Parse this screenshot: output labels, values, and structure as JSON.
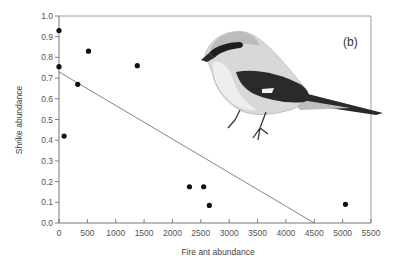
{
  "chart_data": {
    "type": "scatter",
    "title": "",
    "panel_label": "(b)",
    "xlabel": "Fire ant abundance",
    "ylabel": "Shrike abundance",
    "xlim": [
      0,
      5500
    ],
    "ylim": [
      0.0,
      1.0
    ],
    "xticks": [
      0,
      500,
      1000,
      1500,
      2000,
      2500,
      3000,
      3500,
      4000,
      4500,
      5000,
      5500
    ],
    "xtick_labels": [
      "0",
      "500",
      "1000",
      "1500",
      "2000",
      "2500",
      "3000",
      "3500",
      "4000",
      "4500",
      "5000",
      "5500"
    ],
    "yticks": [
      0.0,
      0.1,
      0.2,
      0.3,
      0.4,
      0.5,
      0.6,
      0.7,
      0.8,
      0.9,
      1.0
    ],
    "ytick_labels": [
      "0.0",
      "0.1",
      "0.2",
      "0.3",
      "0.4",
      "0.5",
      "0.6",
      "0.7",
      "0.8",
      "0.9",
      "1.0"
    ],
    "grid": false,
    "series": [
      {
        "name": "sites",
        "x": [
          0,
          520,
          0,
          330,
          90,
          1380,
          2300,
          2550,
          2650,
          5050
        ],
        "y": [
          0.93,
          0.83,
          0.755,
          0.67,
          0.42,
          0.76,
          0.175,
          0.175,
          0.085,
          0.09
        ]
      }
    ],
    "regression_line": {
      "x": [
        0,
        4500
      ],
      "y": [
        0.73,
        0.0
      ]
    },
    "illustration": "loggerhead-shrike-drawing"
  }
}
